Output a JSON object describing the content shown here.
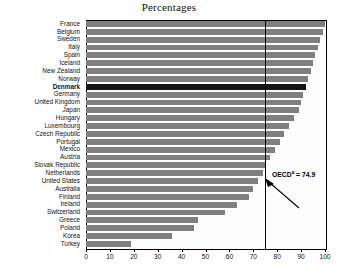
{
  "chart_data": {
    "type": "bar",
    "orientation": "horizontal",
    "title": "Percentages",
    "xlabel": "",
    "ylabel": "",
    "xlim": [
      0,
      100
    ],
    "xticks": [
      0,
      10,
      20,
      30,
      40,
      50,
      60,
      70,
      80,
      90,
      100
    ],
    "grid": false,
    "legend": null,
    "categories": [
      "France",
      "Belgium",
      "Sweden",
      "Italy",
      "Spain",
      "Iceland",
      "New Zealand",
      "Norway",
      "Denmark",
      "Germany",
      "United Kingdom",
      "Japan",
      "Hungary",
      "Luxembourg",
      "Czech Republic",
      "Portugal",
      "Mexico",
      "Austria",
      "Slovak Republic",
      "Netherlands",
      "United States",
      "Australia",
      "Finland",
      "Ireland",
      "Switzerland",
      "Greece",
      "Poland",
      "Korea",
      "Turkey"
    ],
    "values": [
      100,
      99,
      98,
      97,
      96,
      95,
      94,
      93,
      92,
      91,
      90,
      89,
      87,
      85,
      83,
      81,
      79,
      77,
      75,
      74,
      72,
      70,
      68,
      63,
      58,
      47,
      45,
      36,
      19
    ],
    "highlight_category": "Denmark",
    "bar_color": "#7f7f7f",
    "highlight_color": "#141414",
    "reference_line": {
      "label_prefix": "OECD",
      "label_superscript": "a",
      "label_value": "= 74.9",
      "value": 74.9
    }
  }
}
